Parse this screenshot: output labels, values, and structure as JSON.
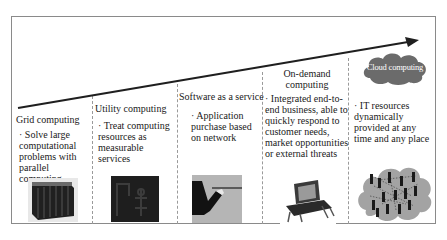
{
  "diagram": {
    "type": "evolution-timeline",
    "arrow": {
      "direction": "up-right",
      "meaning": "evolution"
    },
    "stages": [
      {
        "title": "Grid computing",
        "description": "· Solve large computational problems with parallel computing",
        "image": "supercomputer-racks-image"
      },
      {
        "title": "Utility computing",
        "description": "· Treat computing resources as measurable services",
        "image": "utility-meter-image"
      },
      {
        "title": "Software as a service",
        "description": "· Application purchase based on network",
        "image": "serving-hand-tray-image"
      },
      {
        "title": "On-demand computing",
        "description": "· Integrated end-to-end business, able to quickly respond to customer needs, market opportunities or external threats",
        "image": "laptop-image"
      },
      {
        "title": "Cloud computing",
        "description": "· IT resources dynamically provided at any time and any place",
        "image": "cloud-network-image"
      }
    ]
  },
  "colors": {
    "frame": "#8a8a8a",
    "arrow": "#1f1f1f",
    "cloud": "#6b6b6b",
    "cloud_image": "#9a9a9a"
  }
}
